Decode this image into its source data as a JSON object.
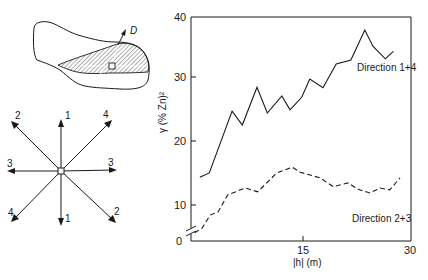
{
  "chart_data": {
    "type": "line",
    "title": "",
    "xlabel": "|h| (m)",
    "ylabel": "γ (% Zn)²",
    "xlim": [
      0,
      30
    ],
    "ylim": [
      0,
      40
    ],
    "y_axis_broken": true,
    "grid": false,
    "x_ticks": [
      15,
      30
    ],
    "y_ticks": [
      0,
      10,
      20,
      30,
      40
    ],
    "legend_position": "inline labels",
    "series": [
      {
        "name": "Direction 1+4",
        "style": "solid",
        "x": [
          1.2,
          2.5,
          5.6,
          7.0,
          9.0,
          10.4,
          12.4,
          13.5,
          15.1,
          16.2,
          18.0,
          19.8,
          21.8,
          23.7,
          24.8,
          26.5,
          27.6
        ],
        "values": [
          14.4,
          15.1,
          24.9,
          22.7,
          28.7,
          24.6,
          27.3,
          25.1,
          27.1,
          30.0,
          28.6,
          32.4,
          33.0,
          37.8,
          35.2,
          33.2,
          34.4
        ]
      },
      {
        "name": "Direction 2+3",
        "style": "dashed",
        "x": [
          0.5,
          1.5,
          2.6,
          3.7,
          5.0,
          7.4,
          9.1,
          11.7,
          13.8,
          14.9,
          17.6,
          19.4,
          21.4,
          22.8,
          24.4,
          25.8,
          27.1,
          28.5
        ],
        "values": [
          5.6,
          6.3,
          8.4,
          8.9,
          11.6,
          12.7,
          12.1,
          15.1,
          16.0,
          15.2,
          14.3,
          12.9,
          13.5,
          12.5,
          11.9,
          12.7,
          12.4,
          14.3
        ]
      }
    ]
  },
  "axes": {
    "y_tick_labels": [
      "0",
      "10",
      "20",
      "30",
      "40"
    ],
    "x_tick_labels": [
      "15",
      "30"
    ],
    "xlabel": "|h| (m)",
    "ylabel": "γ (% Zn)²"
  },
  "series_labels": {
    "s1": "Direction 1+4",
    "s2": "Direction 2+3"
  },
  "orebody_sketch": {
    "direction_label": "D"
  },
  "direction_rose": {
    "labels": {
      "n": "1",
      "s": "1",
      "nw": "2",
      "se": "2",
      "w": "3",
      "e": "3",
      "ne": "4",
      "sw": "4"
    }
  }
}
